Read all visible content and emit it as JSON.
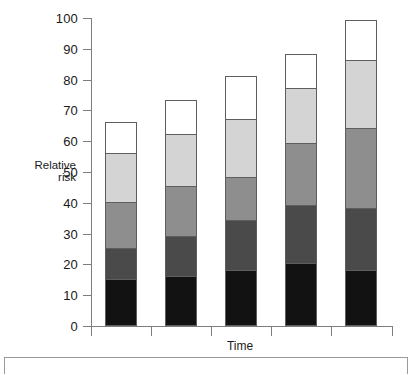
{
  "chart_data": {
    "type": "bar",
    "title": "",
    "subtitle": "",
    "stacked": true,
    "xlabel": "Time",
    "ylabel": "Relative risk",
    "ylabel_line1": "Relative",
    "ylabel_line2": "risk",
    "ylim": [
      0,
      100
    ],
    "ytick_labels": [
      "100",
      "90",
      "80",
      "70",
      "60",
      "50",
      "40",
      "30",
      "20",
      "10",
      "0"
    ],
    "ytick_values": [
      100,
      90,
      80,
      70,
      60,
      50,
      40,
      30,
      20,
      10,
      0
    ],
    "grid": false,
    "legend": "none",
    "categories": [
      "1",
      "2",
      "3",
      "4",
      "5"
    ],
    "series": [
      {
        "name": "segment-1-black",
        "color": "#121212",
        "values": [
          15,
          16,
          18,
          20,
          18
        ]
      },
      {
        "name": "segment-2-dark-gray",
        "color": "#4a4a4a",
        "values": [
          10,
          13,
          16,
          19,
          20
        ]
      },
      {
        "name": "segment-3-medium-gray",
        "color": "#8e8e8e",
        "values": [
          15,
          16,
          14,
          20,
          26
        ]
      },
      {
        "name": "segment-4-light-gray",
        "color": "#d4d4d4",
        "values": [
          16,
          17,
          19,
          18,
          22
        ]
      },
      {
        "name": "segment-5-white",
        "color": "#ffffff",
        "values": [
          10,
          11,
          14,
          11,
          13
        ]
      }
    ],
    "bar_totals": [
      66,
      73,
      81,
      88,
      99
    ],
    "cumulative_tops": [
      [
        15,
        25,
        40,
        56,
        66
      ],
      [
        16,
        29,
        45,
        62,
        73
      ],
      [
        18,
        34,
        48,
        67,
        81
      ],
      [
        20,
        39,
        59,
        77,
        88
      ],
      [
        18,
        38,
        64,
        86,
        99
      ]
    ],
    "axis_color": "#7d7d7d",
    "bar_outline_color": "#5e5e5e",
    "text_color": "#1a1a1a"
  }
}
